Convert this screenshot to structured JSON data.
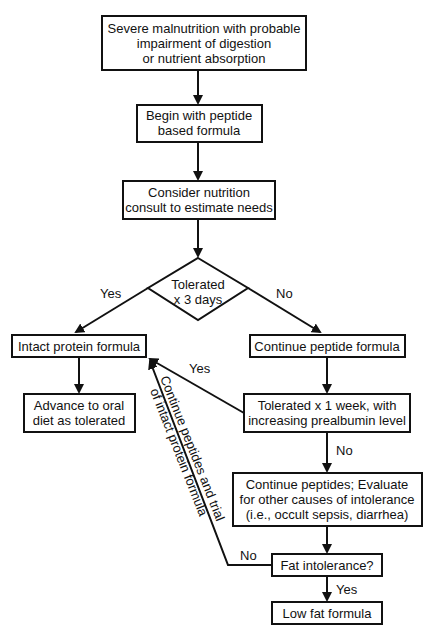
{
  "flowchart": {
    "nodes": {
      "start": {
        "lines": [
          "Severe malnutrition with probable",
          "impairment of digestion",
          "or nutrient absorption"
        ]
      },
      "peptide_begin": {
        "lines": [
          "Begin with peptide",
          "based formula"
        ]
      },
      "consult": {
        "lines": [
          "Consider nutrition",
          "consult to estimate needs"
        ]
      },
      "decision_3days": {
        "lines": [
          "Tolerated",
          "x 3 days"
        ]
      },
      "intact_protein": {
        "lines": [
          "Intact protein formula"
        ]
      },
      "continue_peptide": {
        "lines": [
          "Continue peptide formula"
        ]
      },
      "advance_oral": {
        "lines": [
          "Advance to oral",
          "diet as tolerated"
        ]
      },
      "tolerated_week": {
        "lines": [
          "Tolerated x 1 week, with",
          "increasing prealbumin level"
        ]
      },
      "evaluate": {
        "lines": [
          "Continue peptides; Evaluate",
          "for other causes of intolerance",
          "(i.e., occult sepsis, diarrhea)"
        ]
      },
      "fat_intolerance": {
        "lines": [
          "Fat intolerance?"
        ]
      },
      "low_fat": {
        "lines": [
          "Low fat formula"
        ]
      }
    },
    "edge_labels": {
      "decision_yes": "Yes",
      "decision_no": "No",
      "week_yes": "Yes",
      "week_no": "No",
      "fat_no": "No",
      "fat_yes": "Yes",
      "trial_line1": "Continue peptides and trial",
      "trial_line2": "of intact protein formula"
    },
    "colors": {
      "stroke": "#111111",
      "background": "#ffffff"
    }
  }
}
